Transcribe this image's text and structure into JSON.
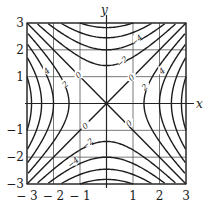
{
  "chart_data": {
    "type": "contour",
    "function": "f(x, y) = x^2 - y^2",
    "title": "",
    "xlabel": "x",
    "ylabel": "y",
    "xlim": [
      -3,
      3
    ],
    "ylim": [
      -3,
      3
    ],
    "grid": true,
    "x_ticks": [
      -3,
      -2,
      -1,
      1,
      2,
      3
    ],
    "y_ticks": [
      -3,
      -2,
      -1,
      1,
      2,
      3
    ],
    "x_tick_labels": [
      "− 3",
      "− 2",
      "− 1",
      "1",
      "2",
      "3"
    ],
    "y_tick_labels": [
      "−3",
      "−2",
      "−1",
      "1",
      "2",
      "3"
    ],
    "levels": [
      -8,
      -6,
      -4,
      -2,
      0,
      2,
      4,
      6,
      8
    ],
    "contour_labels": [
      {
        "text": "0",
        "x": -1.05,
        "y": 1.05
      },
      {
        "text": "0",
        "x": 0.95,
        "y": 0.95
      },
      {
        "text": "0",
        "x": -0.8,
        "y": -0.85
      },
      {
        "text": "0",
        "x": 0.85,
        "y": -0.75
      },
      {
        "text": "2",
        "x": -1.55,
        "y": 0.7
      },
      {
        "text": "4",
        "x": -2.25,
        "y": 1.2
      },
      {
        "text": "2",
        "x": 1.45,
        "y": 0.6
      },
      {
        "text": "4",
        "x": 2.1,
        "y": 1.2
      },
      {
        "text": "−2",
        "x": 0.6,
        "y": 1.55
      },
      {
        "text": "−4",
        "x": 1.15,
        "y": 2.35
      },
      {
        "text": "−2",
        "x": -0.7,
        "y": -1.5
      },
      {
        "text": "−4",
        "x": -1.25,
        "y": -2.2
      }
    ]
  }
}
